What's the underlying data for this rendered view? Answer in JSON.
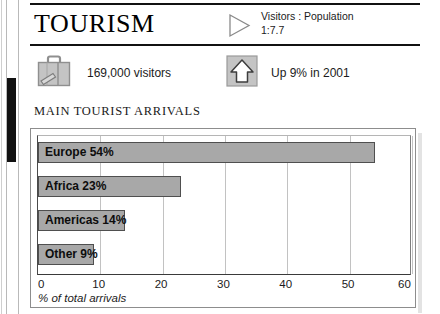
{
  "page": {
    "title": "TOURISM",
    "edge_marker_name": "page-edge-marker"
  },
  "header": {
    "title": "TOURISM",
    "ratio_icon": "triangle-right-icon",
    "ratio_text": "Visitors : Population\n1:7.7",
    "ratio_line1": "Visitors : Population",
    "ratio_line2": "1:7.7"
  },
  "stats": [
    {
      "icon": "suitcase-icon",
      "label": "169,000 visitors"
    },
    {
      "icon": "arrow-up-box-icon",
      "label": "Up 9% in 2001"
    }
  ],
  "chart_heading": "MAIN TOURIST ARRIVALS",
  "chart_data": {
    "type": "bar",
    "orientation": "horizontal",
    "title": "MAIN TOURIST ARRIVALS",
    "categories": [
      "Europe",
      "Africa",
      "Americas",
      "Other"
    ],
    "values": [
      54,
      23,
      14,
      9
    ],
    "bar_labels": [
      "Europe 54%",
      "Africa 23%",
      "Americas 14%",
      "Other 9%"
    ],
    "xlabel": "% of total arrivals",
    "ylabel": "",
    "xlim": [
      0,
      60
    ],
    "xticks": [
      0,
      10,
      20,
      30,
      40,
      50,
      60
    ],
    "xtick_labels": [
      "0",
      "10",
      "20",
      "30",
      "40",
      "50",
      "60"
    ],
    "grid": true,
    "legend": false,
    "bar_color": "#a8a8a8",
    "bar_border_color": "#4f4f4f"
  },
  "colors": {
    "rule": "#111111",
    "icon_fill": "#bdbdbd",
    "icon_stroke": "#6b6b6b",
    "marker": "#111111"
  }
}
